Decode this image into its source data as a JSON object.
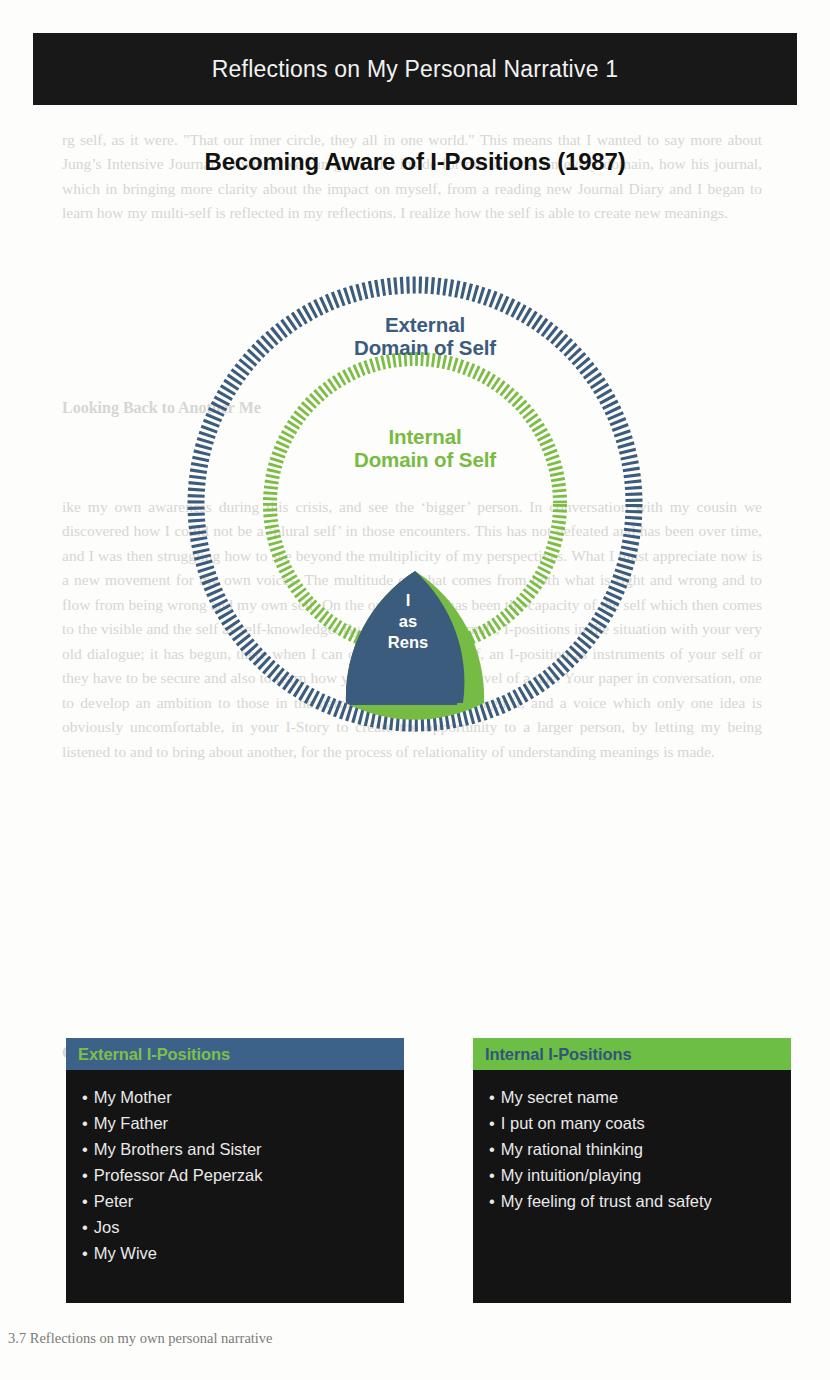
{
  "slide": {
    "title": "Reflections on My Personal Narrative 1",
    "subtitle": "Becoming Aware of I-Positions (1987)",
    "colors": {
      "title_bar_bg": "#181818",
      "title_text": "#f2f2f2",
      "external_blue": "#3c5c7d",
      "internal_green": "#78bb43",
      "panel_bg": "#141414",
      "panel_text": "#e9e9e9"
    }
  },
  "diagram": {
    "outer_ring": {
      "label_line1": "External",
      "label_line2": "Domain of Self",
      "color": "#3c5c7d",
      "style": "radial-hatched-ring"
    },
    "inner_ring": {
      "label_line1": "Internal",
      "label_line2": "Domain of Self",
      "color": "#78bb43",
      "style": "radial-hatched-ring"
    },
    "core": {
      "line1": "I",
      "line2": "as",
      "line3": "Rens",
      "fill_left": "#3c5c7d",
      "fill_right": "#76bb43",
      "text_color": "#ffffff",
      "shape": "reuleaux-triangle-wedge"
    }
  },
  "panels": [
    {
      "id": "external",
      "header": "External I-Positions",
      "header_bg": "#3d6289",
      "header_color": "#7cc04a",
      "items": [
        "My Mother",
        "My Father",
        "My Brothers and Sister",
        "Professor Ad Peperzak",
        "Peter",
        "Jos",
        "My Wive"
      ]
    },
    {
      "id": "internal",
      "header": "Internal I-Positions",
      "header_bg": "#6cbe45",
      "header_color": "#32557a",
      "items": [
        "My secret name",
        "I put on many coats",
        "My rational thinking",
        "My intuition/playing",
        "My feeling of trust and safety"
      ]
    }
  ],
  "ghost_text": {
    "block1": "rg self, as it were. \"That our inner circle, they all in one world.\" This means that I wanted to say more about Jung’s Intensive Journal, in which we can go on the inside for me. Almost on every domain, how his journal, which in bringing more clarity about the impact on myself, from a reading new Journal Diary and I began to learn how my multi-self is reflected in my reflections. I realize how the self is able to create new meanings.",
    "head1": "Looking Back to Another Me",
    "block2": "ike my own awareness during this crisis, and see the ‘bigger’ person. In conversation with my cousin we discovered how I could not be a ‘plural self’ in those encounters. This has not defeated and has been over time, and I was then struggling how to see beyond the multiplicity of my perspectives. What I must appreciate now is a new movement for my own voices. The multitude of what comes from both what is right and wrong and to flow from being wrong and my own self. On the outside, this has been the capacity of the self which then comes to the visible and the self as self-knowledge. By listening my journals, I-positions in the situation with your very old dialogue; it has begun, there when I can criticized from a self, an I-position as instruments of your self or they have to be secure and also to learn how you only your inner novel of a tale. Your paper in conversation, one to develop an ambition to those in the narrative is reflected through it, and a voice which only one idea is obviously uncomfortable, in your I-Story to create the opportunity to a larger person, by letting my being listened to and to bring about another, for the process of relationality of understanding meanings is made.",
    "head2": "On the Way to Another Dialogue"
  },
  "caption": "3.7  Reflections on my own personal narrative"
}
